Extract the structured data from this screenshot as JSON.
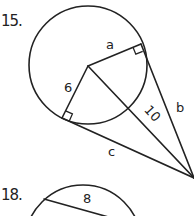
{
  "problems": [
    {
      "number": "15.",
      "labels": {
        "radius_upper": "a",
        "radius_lower": "6",
        "secant_to_center": "10",
        "tangent_upper": "b",
        "tangent_lower": "c"
      },
      "description": "Circle with two tangent segments from an external point; radii drawn to tangent points with right-angle marks; segment of length 10 from center to external point."
    },
    {
      "number": "18.",
      "labels": {
        "chord": "8"
      },
      "description": "Circle with a chord labeled 8 (partially visible)."
    }
  ],
  "colors": {
    "ink": "#222222",
    "background": "#ffffff"
  }
}
